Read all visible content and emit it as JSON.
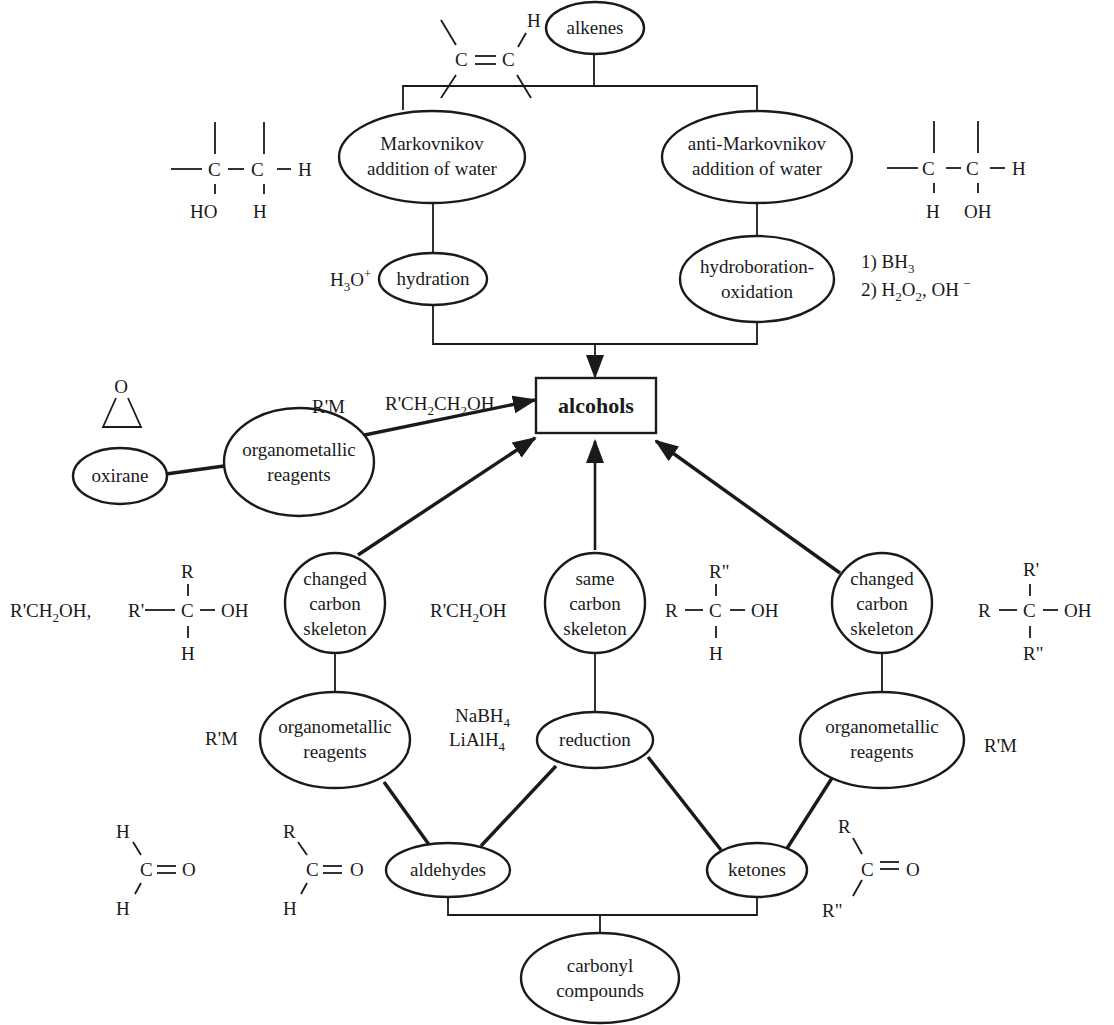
{
  "diagram": {
    "central_node": {
      "label": "alcohols"
    },
    "nodes": {
      "alkenes": {
        "label": "alkenes"
      },
      "markovnikov": {
        "line1": "Markovnikov",
        "line2": "addition of water"
      },
      "anti_markovnikov": {
        "line1": "anti-Markovnikov",
        "line2": "addition of water"
      },
      "hydration": {
        "label": "hydration"
      },
      "hydroboration": {
        "line1": "hydroboration-",
        "line2": "oxidation"
      },
      "oxirane": {
        "label": "oxirane"
      },
      "organometallic_top": {
        "line1": "organometallic",
        "line2": "reagents"
      },
      "changed_left": {
        "line1": "changed",
        "line2": "carbon",
        "line3": "skeleton"
      },
      "same_center": {
        "line1": "same",
        "line2": "carbon",
        "line3": "skeleton"
      },
      "changed_right": {
        "line1": "changed",
        "line2": "carbon",
        "line3": "skeleton"
      },
      "organometallic_left": {
        "line1": "organometallic",
        "line2": "reagents"
      },
      "reduction": {
        "label": "reduction"
      },
      "organometallic_right": {
        "line1": "organometallic",
        "line2": "reagents"
      },
      "aldehydes": {
        "label": "aldehydes"
      },
      "ketones": {
        "label": "ketones"
      },
      "carbonyl": {
        "line1": "carbonyl",
        "line2": "compounds"
      }
    },
    "reagents": {
      "hydration": {
        "base": "H",
        "sub": "3",
        "rest": "O",
        "sup": "+"
      },
      "hydroboration_1": {
        "prefix": "1) BH",
        "sub": "3"
      },
      "hydroboration_2": {
        "prefix": "2) H",
        "sub1": "2",
        "mid": "O",
        "sub2": "2",
        "rest": ", OH",
        "sup": "−"
      },
      "oxirane_rm": "R'M",
      "organometallic_left_rm": "R'M",
      "organometallic_right_rm": "R'M",
      "reduction_1": {
        "base": "NaBH",
        "sub": "4"
      },
      "reduction_2": {
        "base": "LiAlH",
        "sub": "4"
      }
    },
    "products": {
      "oxirane_product": {
        "a": "R'CH",
        "s1": "2",
        "b": "CH",
        "s2": "2",
        "c": "OH"
      },
      "changed_left_primary": {
        "a": "R'CH",
        "s1": "2",
        "b": "OH,"
      },
      "same_center_primary": {
        "a": "R'CH",
        "s1": "2",
        "b": "OH"
      }
    },
    "structures": {
      "alkene": {
        "c1": "C",
        "c2": "C",
        "h": "H"
      },
      "markovnikov_product": {
        "c1": "C",
        "c2": "C",
        "h_right": "H",
        "bottom1": "HO",
        "bottom2": "H"
      },
      "anti_markovnikov_product": {
        "c1": "C",
        "c2": "C",
        "h_right": "H",
        "bottom1": "H",
        "bottom2": "OH"
      },
      "oxirane_ring": {
        "o": "O"
      },
      "secondary_left": {
        "left": "R'",
        "c": "C",
        "right": "OH",
        "top": "R",
        "bottom": "H"
      },
      "secondary_center": {
        "left": "R",
        "c": "C",
        "right": "OH",
        "top": "R\"",
        "bottom": "H"
      },
      "tertiary_right": {
        "left": "R",
        "c": "C",
        "right": "OH",
        "top": "R'",
        "bottom": "R\""
      },
      "formaldehyde": {
        "top": "H",
        "c": "C",
        "o": "O",
        "bottom": "H"
      },
      "aldehyde": {
        "top": "R",
        "c": "C",
        "o": "O",
        "bottom": "H"
      },
      "ketone": {
        "top": "R",
        "c": "C",
        "o": "O",
        "bottom": "R\""
      }
    }
  }
}
